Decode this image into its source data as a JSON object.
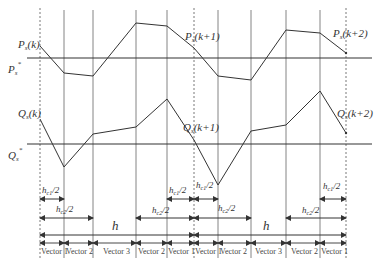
{
  "labels": {
    "ps_k": "P",
    "ps_k_sub": "s",
    "ps_k_arg": "(k)",
    "ps_k1_arg": "(k+1)",
    "ps_k2_arg": "(k+2)",
    "ps_ref": "P",
    "ps_ref_sub": "s",
    "ps_ref_sup": "*",
    "qs": "Q",
    "qs_sub": "s",
    "qs_k_arg": "(k)",
    "qs_k1_arg": "(k+1)",
    "qs_k2_arg": "(k+2)",
    "qs_ref": "Q",
    "qs_ref_sub": "s",
    "qs_ref_sup": "*",
    "hc1": "h",
    "hc1_sub": "c1",
    "hc1_tail": "/2",
    "hc2": "h",
    "hc2_sub": "c2",
    "hc2_tail": "/2",
    "h": "h"
  },
  "vectors": [
    "Vector 1",
    "Vector 2",
    "Vector 3",
    "Vector 2",
    "Vector 1",
    "Vector 1",
    "Vector 2",
    "Vector 3",
    "Vector 2",
    "Vector 1"
  ],
  "colors": {
    "line": "#333333",
    "grid": "#555555"
  }
}
